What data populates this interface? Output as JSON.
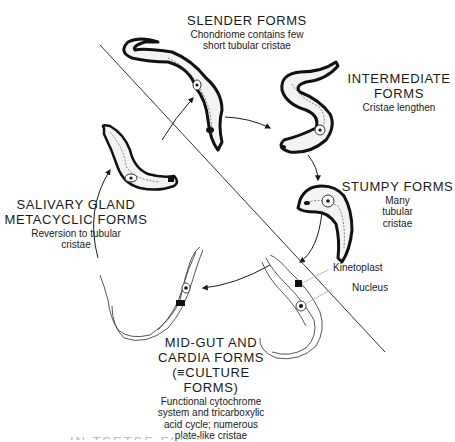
{
  "diagram": {
    "type": "life-cycle",
    "divider_line": {
      "x1": 100,
      "y1": 45,
      "x2": 385,
      "y2": 352
    },
    "stages": [
      {
        "id": "slender",
        "title": "SLENDER FORMS",
        "desc": [
          "Chondriome contains few",
          "short tubular cristae"
        ]
      },
      {
        "id": "intermediate",
        "title": [
          "INTERMEDIATE",
          "FORMS"
        ],
        "desc": [
          "Cristae lengthen"
        ]
      },
      {
        "id": "stumpy",
        "title": "STUMPY FORMS",
        "desc": [
          "Many",
          "tubular",
          "cristae"
        ]
      },
      {
        "id": "midgut",
        "title": [
          "MID-GUT AND",
          "CARDIA FORMS",
          "(≡CULTURE FORMS)"
        ],
        "desc": [
          "Functional cytochrome",
          "system and tricarboxylic",
          "acid cycle; numerous",
          "plate-like cristae"
        ]
      },
      {
        "id": "salivary",
        "title": [
          "SALIVARY GLAND",
          "METACYCLIC FORMS"
        ],
        "desc": [
          "Reversion to tubular",
          "cristae"
        ]
      }
    ],
    "annotations": {
      "kinetoplast": "Kinetoplast",
      "nucleus": "Nucleus"
    },
    "cut_off_text": "IN TSETSE FLIES",
    "arrows": [
      {
        "from": "slender",
        "to": "intermediate"
      },
      {
        "from": "intermediate",
        "to": "stumpy"
      },
      {
        "from": "stumpy",
        "to": "midgut"
      },
      {
        "from": "midgut",
        "to": "salivary"
      },
      {
        "from": "salivary",
        "to": "slender"
      }
    ]
  }
}
